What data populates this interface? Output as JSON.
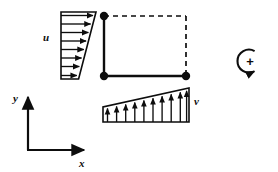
{
  "figure": {
    "kind": "engineering-diagram",
    "background_color": "#ffffff",
    "ink_color": "#0d0d0d"
  },
  "axes": {
    "x_label": "x",
    "y_label": "y",
    "origin": {
      "x": 28,
      "y": 150
    },
    "x_end": {
      "x": 86,
      "y": 150
    },
    "y_end": {
      "x": 28,
      "y": 95
    }
  },
  "element": {
    "name": "quadrilateral-element",
    "left": 104,
    "top": 16,
    "right": 186,
    "bottom": 76,
    "solid_edges": [
      "left",
      "bottom"
    ],
    "dashed_edges": [
      "top",
      "right"
    ],
    "dash_pattern": "5,4",
    "nodes": [
      {
        "id": "node-top-left",
        "x": 104,
        "y": 16
      },
      {
        "id": "node-bottom-left",
        "x": 104,
        "y": 76
      },
      {
        "id": "node-bottom-right",
        "x": 186,
        "y": 76
      }
    ],
    "node_radius": 4.2
  },
  "u_profile": {
    "label": "u",
    "label_x": 45,
    "label_y": 41,
    "direction": "horizontal-right",
    "baseline_x": 61,
    "top_y": 12,
    "bottom_y": 79,
    "top_width": 35,
    "bottom_width": 17,
    "arrow_count": 8,
    "arrow_rows": [
      {
        "y": 15.5,
        "length": 34.2
      },
      {
        "y": 24.0,
        "length": 31.8
      },
      {
        "y": 32.5,
        "length": 29.5
      },
      {
        "y": 41.0,
        "length": 27.1
      },
      {
        "y": 49.5,
        "length": 24.8
      },
      {
        "y": 58.0,
        "length": 22.4
      },
      {
        "y": 66.5,
        "length": 20.1
      },
      {
        "y": 75.5,
        "length": 17.6
      }
    ]
  },
  "v_profile": {
    "label": "v",
    "label_x": 196,
    "label_y": 104,
    "direction": "vertical-up",
    "baseline_y": 122,
    "left_x": 103,
    "right_x": 189,
    "left_height": 15,
    "right_height": 34,
    "arrow_count": 10,
    "arrow_cols": [
      {
        "x": 107.5,
        "height": 16.0
      },
      {
        "x": 116.6,
        "height": 18.1
      },
      {
        "x": 125.7,
        "height": 20.1
      },
      {
        "x": 134.8,
        "height": 22.2
      },
      {
        "x": 143.9,
        "height": 24.2
      },
      {
        "x": 153.0,
        "height": 26.3
      },
      {
        "x": 162.1,
        "height": 28.3
      },
      {
        "x": 171.2,
        "height": 30.4
      },
      {
        "x": 180.3,
        "height": 32.4
      },
      {
        "x": 186.5,
        "height": 33.8
      }
    ]
  },
  "rotation_symbol": {
    "name": "positive-rotation-convention",
    "sign": "+",
    "center_x": 250,
    "center_y": 61,
    "radius": 11.5,
    "sense": "counterclockwise-arc-open-right",
    "sign_x": 250,
    "sign_y": 65.5
  }
}
